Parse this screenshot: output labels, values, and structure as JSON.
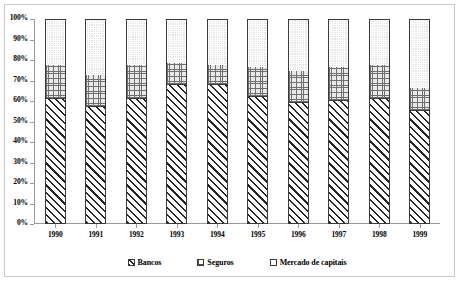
{
  "chart_data": {
    "type": "bar",
    "subtype": "stacked-100-percent",
    "title": "",
    "xlabel": "",
    "ylabel": "",
    "categories": [
      "1990",
      "1991",
      "1992",
      "1993",
      "1994",
      "1995",
      "1996",
      "1997",
      "1998",
      "1999"
    ],
    "series": [
      {
        "name": "Bancos",
        "pattern": "diagonal-hatch",
        "values": [
          61,
          57,
          61,
          68,
          68,
          62,
          59,
          60,
          61,
          55
        ]
      },
      {
        "name": "Seguros",
        "pattern": "cross-hatch-grid",
        "values": [
          17,
          16,
          17,
          11,
          10,
          15,
          16,
          17,
          17,
          12
        ]
      },
      {
        "name": "Mercado de capitais",
        "pattern": "light-dotted",
        "values": [
          22,
          27,
          22,
          21,
          22,
          23,
          25,
          23,
          22,
          33
        ]
      }
    ],
    "cumulative_tops": {
      "bancos": [
        61,
        57,
        61,
        68,
        68,
        62,
        59,
        60,
        61,
        55
      ],
      "seguros": [
        78,
        73,
        78,
        79,
        78,
        77,
        75,
        77,
        78,
        67
      ],
      "mercado": [
        100,
        100,
        100,
        100,
        100,
        100,
        100,
        100,
        100,
        100
      ]
    },
    "ylim": [
      0,
      100
    ],
    "yticks": [
      "0%",
      "10%",
      "20%",
      "30%",
      "40%",
      "50%",
      "60%",
      "70%",
      "80%",
      "90%",
      "100%"
    ],
    "ytick_values": [
      0,
      10,
      20,
      30,
      40,
      50,
      60,
      70,
      80,
      90,
      100
    ],
    "grid": false,
    "legend_position": "bottom-center",
    "legend": [
      "Bancos",
      "Seguros",
      "Mercado de capitais"
    ],
    "colors": {
      "axis": "#9a9a9a",
      "bar_outline": "#3a3a3a",
      "frame": "#c9c9c9",
      "text": "#000000",
      "bancos_fill": "#ffffff",
      "seguros_fill": "#e9e9e9",
      "mercado_fill": "#e2e2e2"
    }
  }
}
